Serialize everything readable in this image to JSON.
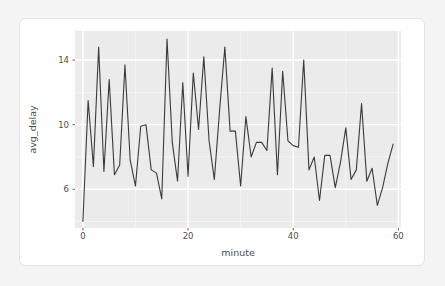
{
  "chart_data": {
    "type": "line",
    "title": "",
    "subtitle": "",
    "xlabel": "minute",
    "ylabel": "avg_delay",
    "xlim": [
      -1.5,
      60.5
    ],
    "ylim": [
      3.6,
      15.8
    ],
    "xticks": [
      0,
      20,
      40,
      60
    ],
    "xtick_labels": [
      "0",
      "20",
      "40",
      "60"
    ],
    "yticks": [
      6,
      10,
      14
    ],
    "ytick_labels": [
      "6",
      "10",
      "14"
    ],
    "grid": true,
    "grid_major_color": "#ffffff",
    "grid_minor_color": "#f5f5f5",
    "panel_background": "#ebebeb",
    "line_color": "#3a3a3a",
    "line_width": 1.1,
    "legend": "none",
    "x": [
      0,
      1,
      2,
      3,
      4,
      5,
      6,
      7,
      8,
      9,
      10,
      11,
      12,
      13,
      14,
      15,
      16,
      17,
      18,
      19,
      20,
      21,
      22,
      23,
      24,
      25,
      26,
      27,
      28,
      29,
      30,
      31,
      32,
      33,
      34,
      35,
      36,
      37,
      38,
      39,
      40,
      41,
      42,
      43,
      44,
      45,
      46,
      47,
      48,
      49,
      50,
      51,
      52,
      53,
      54,
      55,
      56,
      57,
      58,
      59
    ],
    "y": [
      4.0,
      11.5,
      7.4,
      14.8,
      7.1,
      12.8,
      6.9,
      7.5,
      13.7,
      7.8,
      6.2,
      9.9,
      10.0,
      7.2,
      7.0,
      5.4,
      15.3,
      8.9,
      6.5,
      12.6,
      6.8,
      13.2,
      9.7,
      14.2,
      9.0,
      6.6,
      10.9,
      14.8,
      9.6,
      9.6,
      6.2,
      10.5,
      8.0,
      8.9,
      8.9,
      8.4,
      13.5,
      6.9,
      13.3,
      9.0,
      8.7,
      8.6,
      14.0,
      7.2,
      8.0,
      5.3,
      8.1,
      8.1,
      6.1,
      7.7,
      9.8,
      6.6,
      7.2,
      11.3,
      6.5,
      7.3,
      5.0,
      6.1,
      7.6,
      8.8
    ]
  },
  "chart": {
    "axis_y_title": "avg_delay",
    "axis_x_title": "minute"
  }
}
